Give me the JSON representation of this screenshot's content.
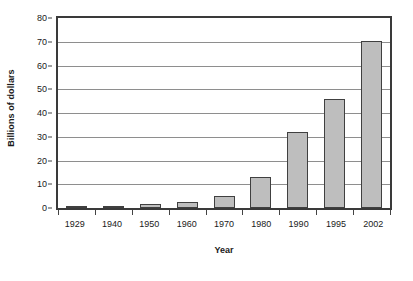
{
  "chart_data": {
    "type": "bar",
    "title": "",
    "xlabel": "Year",
    "ylabel": "Billions of dollars",
    "categories": [
      "1929",
      "1940",
      "1950",
      "1960",
      "1970",
      "1980",
      "1990",
      "1995",
      "2002"
    ],
    "values": [
      0.8,
      0.9,
      1.6,
      2.7,
      5.2,
      13.0,
      32.0,
      46.0,
      70.5
    ],
    "series": [
      {
        "name": "Billions of dollars",
        "values": [
          0.8,
          0.9,
          1.6,
          2.7,
          5.2,
          13.0,
          32.0,
          46.0,
          70.5
        ]
      }
    ],
    "ylim": [
      0,
      80
    ],
    "ytick_values": [
      0,
      10,
      20,
      30,
      40,
      50,
      60,
      70,
      80
    ],
    "ytick_labels": [
      "0",
      "10",
      "20",
      "30",
      "40",
      "50",
      "60",
      "70",
      "80"
    ],
    "ytick_step": 10,
    "grid": true,
    "grid_axis": "y",
    "legend": false,
    "legend_position": "none",
    "bar_color": "#BEBEBE",
    "bar_border_color": "#404040",
    "gridline_color": "#8E8E8E",
    "axis_color": "#3A3A3A",
    "background_color": "#FFFFFF",
    "text_color": "#1A1A1A"
  }
}
